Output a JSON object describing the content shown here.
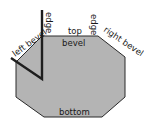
{
  "diagram": {
    "type": "octagon-bevel-cross-section",
    "colors": {
      "fill": "#b4b4b4",
      "outline": "#2a2a2a",
      "marker": "#1e1e1e",
      "text": "#1a1a1a",
      "background": "#ffffff"
    },
    "labels": {
      "left_bevel": "left bevel",
      "edge_left": "edge",
      "top": "top",
      "edge_right": "edge",
      "right_bevel": "right bevel",
      "bevel": "bevel",
      "bottom": "bottom"
    }
  }
}
